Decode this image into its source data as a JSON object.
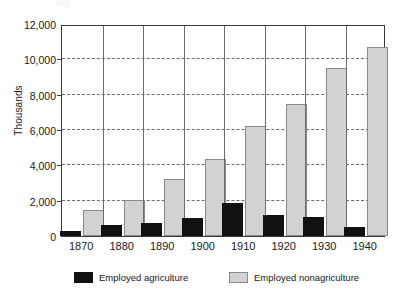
{
  "chart_data": {
    "type": "bar",
    "title": "",
    "xlabel": "",
    "ylabel": "Thousands",
    "categories": [
      "1870",
      "1880",
      "1890",
      "1900",
      "1910",
      "1920",
      "1930",
      "1940"
    ],
    "series": [
      {
        "name": "Employed agriculture",
        "color": "#111111",
        "values": [
          300,
          600,
          750,
          1000,
          1850,
          1200,
          1100,
          500
        ]
      },
      {
        "name": "Employed nonagriculture",
        "color": "#d2d2d2",
        "values": [
          1450,
          2050,
          3200,
          4350,
          6250,
          7450,
          9500,
          10700
        ]
      }
    ],
    "ylim": [
      0,
      12000
    ],
    "ytick_values": [
      0,
      2000,
      4000,
      6000,
      8000,
      10000,
      12000
    ],
    "ytick_labels": [
      "0",
      "2,000",
      "4,000",
      "6,000",
      "8,000",
      "10,000",
      "12,000"
    ],
    "grid": "horizontal-dashed-plus-vertical-group-separators",
    "legend_position": "bottom",
    "legend": [
      {
        "label": "Employed agriculture",
        "swatch": "black-filled"
      },
      {
        "label": "Employed nonagriculture",
        "swatch": "light-gray-outlined"
      }
    ]
  }
}
